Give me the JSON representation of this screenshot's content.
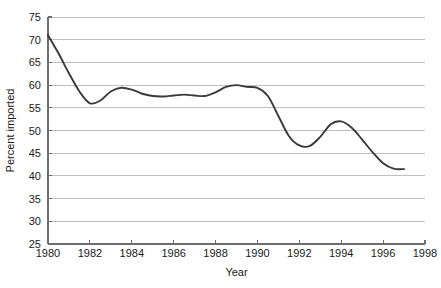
{
  "chart_data": {
    "type": "line",
    "title": "",
    "xlabel": "Year",
    "ylabel": "Percent imported",
    "xlim": [
      1980,
      1998
    ],
    "ylim": [
      25,
      75
    ],
    "grid": true,
    "legend": "none",
    "line_color": "#3a3a3a",
    "grid_color": "#b8b8b8",
    "axis_color": "#6e6e6e",
    "xticks": [
      1980,
      1982,
      1984,
      1986,
      1988,
      1990,
      1992,
      1994,
      1996,
      1998
    ],
    "xtick_labels": [
      "1980",
      "1982",
      "1984",
      "1986",
      "1988",
      "1990",
      "1992",
      "1994",
      "1996",
      "1998"
    ],
    "yticks": [
      25,
      30,
      35,
      40,
      45,
      50,
      55,
      60,
      65,
      70,
      75
    ],
    "ytick_labels": [
      "25",
      "30",
      "35",
      "40",
      "45",
      "50",
      "55",
      "60",
      "65",
      "70",
      "75"
    ],
    "series": [
      {
        "name": "Percent imported",
        "x": [
          1980,
          1980.5,
          1981,
          1981.5,
          1982,
          1982.5,
          1983,
          1983.5,
          1984,
          1984.5,
          1985,
          1985.5,
          1986,
          1986.5,
          1987,
          1987.5,
          1988,
          1988.5,
          1989,
          1989.5,
          1990,
          1990.5,
          1991,
          1991.5,
          1992,
          1992.5,
          1993,
          1993.5,
          1994,
          1994.5,
          1995,
          1995.5,
          1996,
          1996.5,
          1997
        ],
        "y": [
          71.0,
          67.0,
          62.6,
          58.6,
          56.0,
          56.6,
          58.6,
          59.4,
          59.0,
          58.1,
          57.6,
          57.5,
          57.7,
          57.9,
          57.7,
          57.6,
          58.4,
          59.6,
          60.0,
          59.6,
          59.4,
          57.6,
          53.2,
          48.8,
          46.7,
          46.6,
          48.6,
          51.4,
          52.0,
          50.6,
          48.0,
          45.2,
          42.8,
          41.6,
          41.5
        ]
      }
    ],
    "annotations": {
      "start_value": 71.0,
      "min_1982": 56.0,
      "plateau_range": [
        57.5,
        60.0
      ],
      "trough_1992": 46.6,
      "peak_1993_94": 52.0,
      "end_value": 41.5
    }
  },
  "geometry": {
    "plot_left": 48,
    "plot_right": 425,
    "plot_top": 17,
    "plot_bottom": 244
  }
}
